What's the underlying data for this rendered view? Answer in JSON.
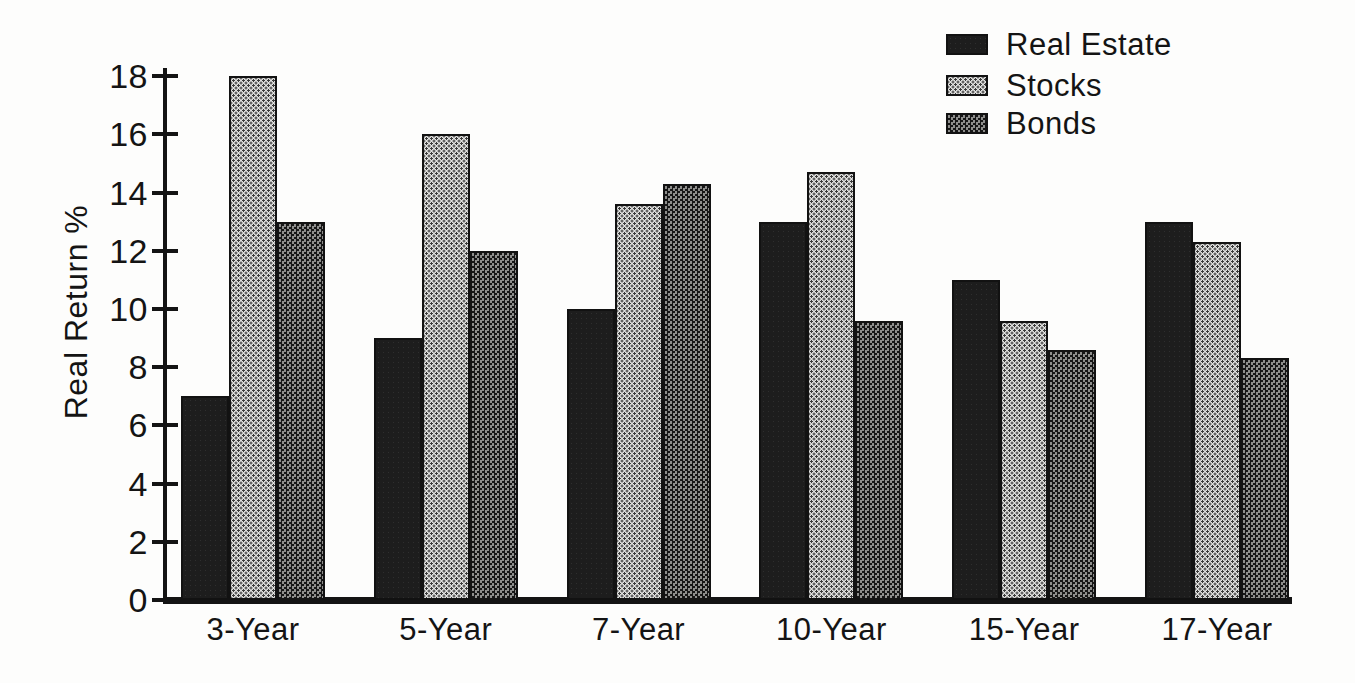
{
  "chart_data": {
    "type": "bar",
    "title": "",
    "xlabel": "",
    "ylabel": "Real Return %",
    "ylim": [
      0,
      18
    ],
    "yticks": [
      0,
      2,
      4,
      6,
      8,
      10,
      12,
      14,
      16,
      18
    ],
    "grid": false,
    "legend_position": "top-right",
    "categories": [
      "3-Year",
      "5-Year",
      "7-Year",
      "10-Year",
      "15-Year",
      "17-Year"
    ],
    "series": [
      {
        "name": "Real Estate",
        "pattern": "solid-dark",
        "color": "#1d1d1d",
        "values": [
          7.0,
          9.0,
          10.0,
          13.0,
          11.0,
          13.0
        ]
      },
      {
        "name": "Stocks",
        "pattern": "light-halftone-dots",
        "color": "#e2e2e0",
        "values": [
          18.0,
          16.0,
          13.6,
          14.7,
          9.6,
          12.3
        ]
      },
      {
        "name": "Bonds",
        "pattern": "dark-halftone-dots",
        "color": "#4a4a4a",
        "values": [
          13.0,
          12.0,
          14.3,
          9.6,
          8.6,
          8.3
        ]
      }
    ],
    "axis_color": "#141414",
    "background_color": "#fdfdfc"
  }
}
